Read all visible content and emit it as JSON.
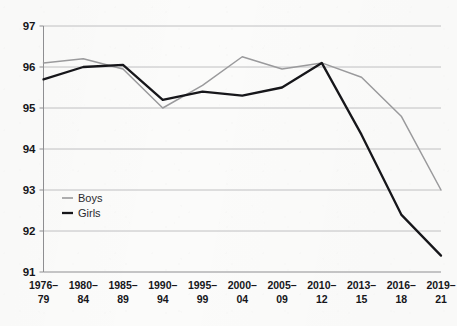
{
  "chart_data": {
    "type": "line",
    "title": "",
    "xlabel": "",
    "ylabel": "",
    "categories": [
      "1976–\n79",
      "1980–\n84",
      "1985–\n89",
      "1990–\n94",
      "1995–\n99",
      "2000–\n04",
      "2005–\n09",
      "2010–\n12",
      "2013–\n15",
      "2016–\n18",
      "2019–\n21"
    ],
    "category_lines": [
      [
        "1976–",
        "79"
      ],
      [
        "1980–",
        "84"
      ],
      [
        "1985–",
        "89"
      ],
      [
        "1990–",
        "94"
      ],
      [
        "1995–",
        "99"
      ],
      [
        "2000–",
        "04"
      ],
      [
        "2005–",
        "09"
      ],
      [
        "2010–",
        "12"
      ],
      [
        "2013–",
        "15"
      ],
      [
        "2016–",
        "18"
      ],
      [
        "2019–",
        "21"
      ]
    ],
    "series": [
      {
        "name": "Boys",
        "color": "#9a9a9c",
        "values": [
          96.1,
          96.2,
          95.95,
          95.0,
          95.55,
          96.25,
          95.95,
          96.1,
          95.75,
          94.8,
          93.0
        ]
      },
      {
        "name": "Girls",
        "color": "#16161a",
        "values": [
          95.7,
          96.0,
          96.05,
          95.2,
          95.4,
          95.3,
          95.5,
          96.1,
          94.35,
          92.4,
          91.4
        ]
      }
    ],
    "ylim": [
      91,
      97
    ],
    "ytick_values": [
      91,
      92,
      93,
      94,
      95,
      96,
      97
    ],
    "ytick_labels": [
      "91",
      "92",
      "93",
      "94",
      "95",
      "96",
      "97"
    ],
    "grid": true,
    "legend_position": "lower-left",
    "legend": [
      {
        "label": "Boys",
        "color": "#9a9a9c"
      },
      {
        "label": "Girls",
        "color": "#16161a"
      }
    ]
  }
}
